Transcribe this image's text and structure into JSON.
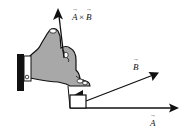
{
  "diagram": {
    "labels": {
      "cross": {
        "a": "A",
        "times": "×",
        "b": "B"
      },
      "vector_a": "A",
      "vector_b": "B"
    },
    "colors": {
      "ink": "#111111",
      "hand_fill": "#a8a8a8",
      "cuff": "#111111",
      "background": "#ffffff"
    },
    "vectors": [
      {
        "name": "A",
        "from": [
          70,
          108
        ],
        "to": [
          178,
          108
        ]
      },
      {
        "name": "B",
        "from": [
          86,
          101
        ],
        "to": [
          158,
          73
        ]
      },
      {
        "name": "A×B",
        "from": [
          62,
          58
        ],
        "to": [
          58,
          10
        ]
      }
    ]
  }
}
